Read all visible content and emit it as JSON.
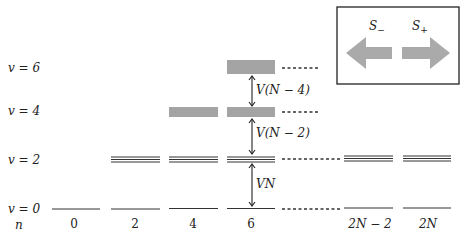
{
  "diagram": {
    "type": "energy-level-diagram",
    "y_axis": {
      "label_prefix": "v",
      "levels": [
        {
          "label": "v = 6",
          "v": 6,
          "y": 88
        },
        {
          "label": "v = 4",
          "v": 4,
          "y": 113
        },
        {
          "label": "v = 2",
          "v": 2,
          "y": 159
        },
        {
          "label": "v = 0",
          "v": 0,
          "y": 208
        }
      ]
    },
    "x_axis": {
      "label": "n",
      "ticks": [
        {
          "label": "0",
          "x": 74
        },
        {
          "label": "2",
          "x": 135
        },
        {
          "label": "4",
          "x": 193
        },
        {
          "label": "6",
          "x": 251
        },
        {
          "label": "2N − 2",
          "x": 386
        },
        {
          "label": "2N",
          "x": 444
        }
      ]
    },
    "gaps": [
      {
        "label": "V(N − 4)",
        "between": [
          "v = 4",
          "v = 6"
        ]
      },
      {
        "label": "V(N − 2)",
        "between": [
          "v = 2",
          "v = 4"
        ]
      },
      {
        "label": "VN",
        "between": [
          "v = 0",
          "v = 2"
        ]
      }
    ],
    "legend": {
      "lowering_operator": "S",
      "lowering_sub": "−",
      "raising_operator": "S",
      "raising_sub": "+",
      "arrow_color": "#aaaaaa",
      "box_border": "#222222"
    },
    "colors": {
      "line": "#333333",
      "dotted": "#333333",
      "text": "#222222"
    }
  }
}
